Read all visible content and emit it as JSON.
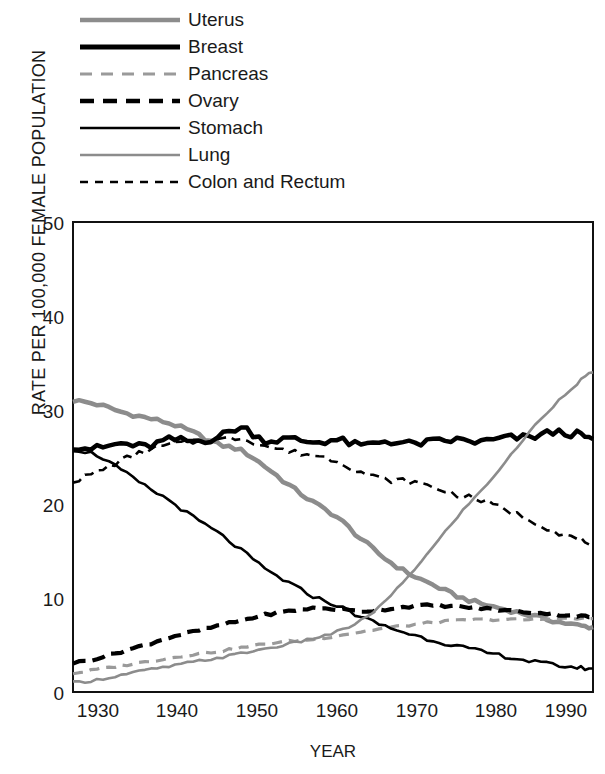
{
  "chart_data": {
    "type": "line",
    "title": "",
    "xlabel": "YEAR",
    "ylabel": "RATE PER 100,000 FEMALE POPULATION",
    "xlim": [
      1927,
      1992
    ],
    "ylim": [
      0,
      50
    ],
    "xticks": [
      "1930",
      "1940",
      "1950",
      "1960",
      "1970",
      "1980",
      "1990"
    ],
    "yticks": [
      "0",
      "10",
      "20",
      "30",
      "40",
      "50"
    ],
    "grid": false,
    "legend_position": "above-plot",
    "x": [
      1927,
      1930,
      1933,
      1936,
      1939,
      1942,
      1945,
      1948,
      1951,
      1954,
      1957,
      1960,
      1963,
      1966,
      1969,
      1972,
      1975,
      1978,
      1981,
      1984,
      1987,
      1990,
      1992
    ],
    "series": [
      {
        "name": "Uterus",
        "style": "solid-thick-gray",
        "color": "#8c8c8c",
        "width": 4.5,
        "dash": "none",
        "values": [
          31.0,
          30.6,
          29.8,
          29.2,
          28.6,
          27.6,
          26.4,
          25.7,
          24.0,
          22.0,
          20.2,
          18.6,
          16.3,
          14.2,
          12.6,
          11.4,
          10.2,
          9.4,
          8.8,
          8.2,
          7.6,
          7.1,
          6.9
        ]
      },
      {
        "name": "Breast",
        "style": "solid-thick-black",
        "color": "#000000",
        "width": 4.5,
        "dash": "none",
        "values": [
          26.2,
          25.9,
          26.4,
          26.1,
          26.8,
          26.7,
          27.1,
          28.1,
          26.8,
          26.9,
          26.6,
          26.8,
          26.2,
          26.7,
          26.4,
          26.6,
          26.8,
          26.6,
          27.0,
          27.1,
          27.6,
          27.4,
          26.9
        ]
      },
      {
        "name": "Pancreas",
        "style": "dashed-gray",
        "color": "#9a9a9a",
        "width": 3.2,
        "dash": "10,7",
        "values": [
          2.0,
          2.4,
          2.8,
          3.2,
          3.6,
          4.0,
          4.3,
          4.7,
          5.1,
          5.4,
          5.6,
          6.0,
          6.4,
          6.8,
          7.1,
          7.4,
          7.6,
          7.7,
          7.7,
          7.7,
          7.8,
          7.8,
          7.8
        ]
      },
      {
        "name": "Ovary",
        "style": "dashed-thick-black",
        "color": "#000000",
        "width": 4.2,
        "dash": "13,7",
        "values": [
          3.1,
          3.6,
          4.3,
          5.0,
          5.8,
          6.4,
          7.0,
          7.6,
          8.2,
          8.6,
          8.9,
          8.8,
          8.6,
          8.8,
          9.1,
          9.2,
          9.1,
          8.9,
          8.7,
          8.5,
          8.3,
          8.1,
          8.0
        ]
      },
      {
        "name": "Stomach",
        "style": "solid-thin-black",
        "color": "#000000",
        "width": 2.6,
        "dash": "none",
        "values": [
          25.8,
          25.2,
          23.6,
          21.9,
          20.4,
          18.6,
          17.0,
          15.1,
          13.1,
          11.6,
          10.2,
          9.2,
          8.0,
          7.0,
          6.2,
          5.5,
          4.9,
          4.3,
          3.8,
          3.3,
          2.9,
          2.6,
          2.5
        ]
      },
      {
        "name": "Lung",
        "style": "solid-thin-gray",
        "color": "#8c8c8c",
        "width": 2.6,
        "dash": "none",
        "values": [
          1.0,
          1.3,
          1.8,
          2.3,
          2.7,
          3.2,
          3.6,
          4.1,
          4.6,
          5.1,
          5.7,
          6.4,
          7.6,
          9.6,
          12.4,
          15.4,
          18.6,
          21.4,
          24.4,
          27.6,
          30.4,
          32.8,
          34.0
        ]
      },
      {
        "name": "Colon and Rectum",
        "style": "dashed-thin-black",
        "color": "#000000",
        "width": 2.6,
        "dash": "9,6",
        "values": [
          22.5,
          23.4,
          24.6,
          25.6,
          26.3,
          26.6,
          26.8,
          27.0,
          26.2,
          25.6,
          25.2,
          24.6,
          23.4,
          22.6,
          22.4,
          21.8,
          21.0,
          20.4,
          19.4,
          18.4,
          17.2,
          16.3,
          15.9
        ]
      }
    ]
  },
  "legend": {
    "items": [
      {
        "label": "Uterus"
      },
      {
        "label": "Breast"
      },
      {
        "label": "Pancreas"
      },
      {
        "label": "Ovary"
      },
      {
        "label": "Stomach"
      },
      {
        "label": "Lung"
      },
      {
        "label": "Colon and Rectum"
      }
    ]
  }
}
